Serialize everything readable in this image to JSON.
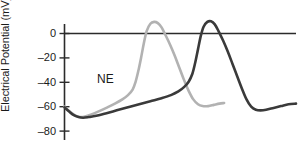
{
  "chart_data": {
    "type": "line",
    "title": "",
    "subtitle": "",
    "xlabel": "",
    "ylabel": "Electrical Potential (mV)",
    "ylim": [
      -90,
      18
    ],
    "yticks": [
      0,
      -20,
      -40,
      -60,
      -80
    ],
    "ytick_labels": [
      "0",
      "–20",
      "–40",
      "–60",
      "–80"
    ],
    "xlim": [
      0,
      100
    ],
    "xticks": [],
    "xtick_labels": [],
    "grid": false,
    "legend_position": "inline-annotation",
    "zero_line": true,
    "annotations": [
      {
        "text": "NE",
        "x": 15,
        "y": -44
      }
    ],
    "series": [
      {
        "name": "NE-treated action potential",
        "color": "#b2b2b2",
        "linewidth": 2.6,
        "points": [
          {
            "x": 0.0,
            "y": -60.0
          },
          {
            "x": 2.5,
            "y": -63.5
          },
          {
            "x": 5.0,
            "y": -66.5
          },
          {
            "x": 7.0,
            "y": -68.0
          },
          {
            "x": 9.0,
            "y": -68.5
          },
          {
            "x": 11.0,
            "y": -68.0
          },
          {
            "x": 14.0,
            "y": -66.5
          },
          {
            "x": 18.0,
            "y": -64.0
          },
          {
            "x": 23.0,
            "y": -60.5
          },
          {
            "x": 27.0,
            "y": -57.5
          },
          {
            "x": 31.0,
            "y": -54.0
          },
          {
            "x": 34.0,
            "y": -50.5
          },
          {
            "x": 36.5,
            "y": -46.0
          },
          {
            "x": 38.0,
            "y": -40.0
          },
          {
            "x": 39.5,
            "y": -31.0
          },
          {
            "x": 41.0,
            "y": -20.0
          },
          {
            "x": 42.5,
            "y": -8.0
          },
          {
            "x": 44.0,
            "y": 2.0
          },
          {
            "x": 46.0,
            "y": 8.0
          },
          {
            "x": 48.0,
            "y": 9.5
          },
          {
            "x": 50.0,
            "y": 8.5
          },
          {
            "x": 52.0,
            "y": 5.0
          },
          {
            "x": 54.0,
            "y": -1.0
          },
          {
            "x": 56.5,
            "y": -9.0
          },
          {
            "x": 59.0,
            "y": -18.0
          },
          {
            "x": 61.5,
            "y": -28.0
          },
          {
            "x": 64.0,
            "y": -38.0
          },
          {
            "x": 66.5,
            "y": -47.0
          },
          {
            "x": 69.0,
            "y": -54.0
          },
          {
            "x": 71.5,
            "y": -58.0
          },
          {
            "x": 74.0,
            "y": -59.5
          },
          {
            "x": 77.0,
            "y": -59.5
          },
          {
            "x": 80.0,
            "y": -58.5
          },
          {
            "x": 83.0,
            "y": -57.5
          },
          {
            "x": 85.5,
            "y": -57.0
          }
        ]
      },
      {
        "name": "Control action potential",
        "color": "#3a3a3a",
        "linewidth": 2.6,
        "points": [
          {
            "x": 0.0,
            "y": -60.5
          },
          {
            "x": 2.5,
            "y": -64.0
          },
          {
            "x": 5.0,
            "y": -67.0
          },
          {
            "x": 7.5,
            "y": -68.5
          },
          {
            "x": 10.0,
            "y": -69.0
          },
          {
            "x": 13.0,
            "y": -68.5
          },
          {
            "x": 17.0,
            "y": -67.5
          },
          {
            "x": 22.0,
            "y": -65.5
          },
          {
            "x": 28.0,
            "y": -63.0
          },
          {
            "x": 34.0,
            "y": -60.5
          },
          {
            "x": 40.0,
            "y": -58.0
          },
          {
            "x": 46.0,
            "y": -55.5
          },
          {
            "x": 52.0,
            "y": -53.0
          },
          {
            "x": 57.0,
            "y": -50.5
          },
          {
            "x": 61.0,
            "y": -47.5
          },
          {
            "x": 64.0,
            "y": -44.0
          },
          {
            "x": 66.5,
            "y": -39.5
          },
          {
            "x": 68.5,
            "y": -33.0
          },
          {
            "x": 70.0,
            "y": -24.0
          },
          {
            "x": 71.5,
            "y": -13.0
          },
          {
            "x": 73.0,
            "y": -2.0
          },
          {
            "x": 74.5,
            "y": 5.5
          },
          {
            "x": 76.5,
            "y": 9.5
          },
          {
            "x": 78.5,
            "y": 10.0
          },
          {
            "x": 80.5,
            "y": 7.5
          },
          {
            "x": 82.5,
            "y": 2.0
          },
          {
            "x": 85.0,
            "y": -6.0
          },
          {
            "x": 87.5,
            "y": -15.0
          },
          {
            "x": 90.0,
            "y": -25.0
          },
          {
            "x": 92.5,
            "y": -35.0
          },
          {
            "x": 95.0,
            "y": -45.0
          },
          {
            "x": 97.5,
            "y": -54.0
          },
          {
            "x": 100.0,
            "y": -60.0
          },
          {
            "x": 102.5,
            "y": -62.5
          },
          {
            "x": 105.0,
            "y": -63.0
          },
          {
            "x": 108.0,
            "y": -62.5
          },
          {
            "x": 112.0,
            "y": -61.0
          },
          {
            "x": 116.0,
            "y": -59.5
          },
          {
            "x": 120.0,
            "y": -58.0
          },
          {
            "x": 124.0,
            "y": -57.5
          }
        ]
      }
    ]
  },
  "axis": {
    "y_title": "Electrical Potential (mV)",
    "tick_0": "0",
    "tick_m20": "–20",
    "tick_m40": "–40",
    "tick_m60": "–60",
    "tick_m80": "–80"
  },
  "labels": {
    "ne": "NE"
  },
  "colors": {
    "ne_curve": "#b2b2b2",
    "control_curve": "#3a3a3a",
    "axis": "#2b2b2b",
    "background": "#ffffff",
    "text": "#1a1a1a"
  }
}
